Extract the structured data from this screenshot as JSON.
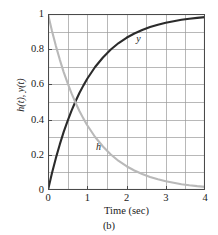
{
  "caption": "(b)",
  "chart_data": {
    "type": "line",
    "title": "",
    "subtitle": "",
    "xlabel": "Time (sec)",
    "ylabel": "h(t), y(t)",
    "xlim": [
      0,
      4
    ],
    "ylim": [
      0,
      1
    ],
    "xticks": [
      0,
      1,
      2,
      3,
      4
    ],
    "xtick_labels": [
      "0",
      "1",
      "2",
      "3",
      "4"
    ],
    "yticks": [
      0,
      0.2,
      0.4,
      0.6,
      0.8,
      1
    ],
    "ytick_labels": [
      "0",
      "0.2",
      "0.4",
      "0.6",
      "0.8",
      "1"
    ],
    "grid": true,
    "grid_x_step": 0.5,
    "grid_y_step": 0.1,
    "grid_color": "#9a9a9a",
    "frame_color": "#4a4a4a",
    "background": "#ffffff",
    "legend": "inline-annotations",
    "legend_position": "inline",
    "annotations": [
      {
        "text": "y",
        "x": 2.25,
        "y": 0.885,
        "name": "y-curve-label"
      },
      {
        "text": "h",
        "x": 1.22,
        "y": 0.275,
        "name": "h-curve-label"
      }
    ],
    "series": [
      {
        "name": "y",
        "label": "y",
        "formula": "y(t) = 1 - exp(-t)",
        "color": "#2b2b2b",
        "line_width": 2.1,
        "x": [
          0,
          0.1,
          0.2,
          0.3,
          0.4,
          0.5,
          0.6,
          0.7,
          0.8,
          0.9,
          1.0,
          1.2,
          1.4,
          1.6,
          1.8,
          2.0,
          2.2,
          2.4,
          2.6,
          2.8,
          3.0,
          3.2,
          3.4,
          3.6,
          3.8,
          4.0
        ],
        "values": [
          0,
          0.095,
          0.181,
          0.259,
          0.33,
          0.393,
          0.451,
          0.503,
          0.551,
          0.593,
          0.632,
          0.699,
          0.753,
          0.798,
          0.835,
          0.865,
          0.889,
          0.909,
          0.926,
          0.939,
          0.95,
          0.959,
          0.967,
          0.973,
          0.978,
          0.982
        ]
      },
      {
        "name": "h",
        "label": "h",
        "formula": "h(t) = exp(-t)",
        "color": "#b9b9b9",
        "line_width": 2.1,
        "x": [
          0,
          0.1,
          0.2,
          0.3,
          0.4,
          0.5,
          0.6,
          0.7,
          0.8,
          0.9,
          1.0,
          1.2,
          1.4,
          1.6,
          1.8,
          2.0,
          2.2,
          2.4,
          2.6,
          2.8,
          3.0,
          3.2,
          3.4,
          3.6,
          3.8,
          4.0
        ],
        "values": [
          1,
          0.905,
          0.819,
          0.741,
          0.67,
          0.607,
          0.549,
          0.497,
          0.449,
          0.407,
          0.368,
          0.301,
          0.247,
          0.202,
          0.165,
          0.135,
          0.111,
          0.091,
          0.074,
          0.061,
          0.05,
          0.041,
          0.033,
          0.027,
          0.022,
          0.018
        ]
      }
    ]
  }
}
